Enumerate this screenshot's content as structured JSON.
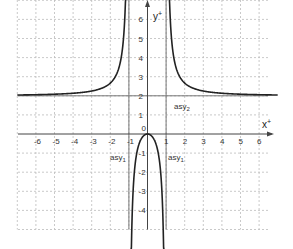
{
  "chart_data": {
    "type": "line",
    "title": "",
    "xlabel": "x",
    "ylabel": "y",
    "xlim": [
      -7,
      7
    ],
    "ylim": [
      -5,
      7
    ],
    "grid": true,
    "x_ticks": [
      "-6",
      "-5",
      "-4",
      "-3",
      "-2",
      "-1",
      "0",
      "1",
      "2",
      "3",
      "4",
      "5",
      "6"
    ],
    "y_ticks": [
      "6",
      "5",
      "4",
      "3",
      "2",
      "1",
      "-1",
      "-2",
      "-3",
      "-4"
    ],
    "function": "f(x) = 2x^2 / (x^2 - 1)",
    "asymptotes": [
      {
        "label": "asy1",
        "type": "vertical",
        "value": -1
      },
      {
        "label": "asy1",
        "type": "vertical",
        "value": 1
      },
      {
        "label": "asy2",
        "type": "horizontal",
        "value": 2
      }
    ],
    "series": [
      {
        "name": "left branch",
        "x": [
          -7,
          -6,
          -5,
          -4,
          -3,
          -2,
          -1.5,
          -1.2,
          -1.1
        ],
        "y": [
          2.04,
          2.06,
          2.08,
          2.13,
          2.25,
          2.67,
          3.6,
          6.55,
          11.5
        ]
      },
      {
        "name": "middle branch",
        "x": [
          -0.9,
          -0.8,
          -0.6,
          -0.4,
          -0.2,
          0,
          0.2,
          0.4,
          0.6,
          0.8,
          0.9
        ],
        "y": [
          -8.5,
          -3.56,
          -1.13,
          -0.38,
          -0.08,
          0,
          -0.08,
          -0.38,
          -1.13,
          -3.56,
          -8.5
        ]
      },
      {
        "name": "right branch",
        "x": [
          1.1,
          1.2,
          1.5,
          2,
          3,
          4,
          5,
          6,
          7
        ],
        "y": [
          11.5,
          6.55,
          3.6,
          2.67,
          2.25,
          2.13,
          2.08,
          2.06,
          2.04
        ]
      }
    ]
  },
  "labels": {
    "x_axis": "x",
    "y_axis": "y",
    "origin": "0",
    "asy1_left": "asy",
    "asy1_right": "asy",
    "asy2": "asy",
    "asy1_sub": "1",
    "asy2_sub": "2"
  }
}
